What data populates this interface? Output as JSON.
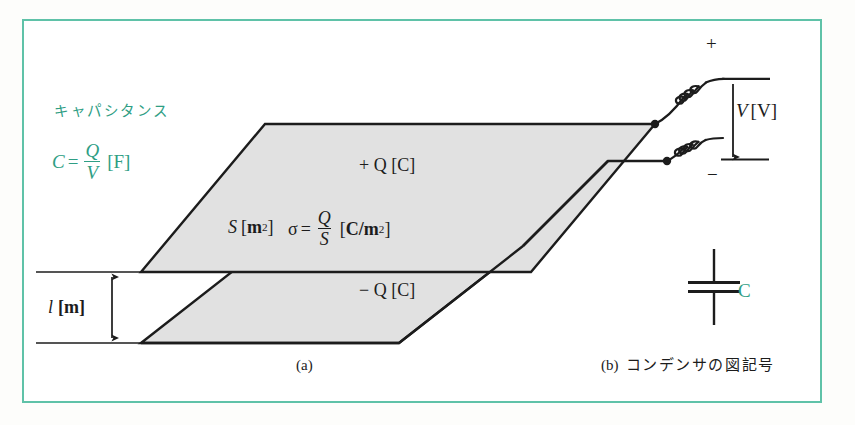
{
  "figure": {
    "title_jp": "キャパシタンス",
    "frame_color": "#5fc2a8",
    "accent_color": "#2f9e84",
    "line_color": "#1c1c1c",
    "plate_fill": "#e0e0e0"
  },
  "panel_a": {
    "caption": "(a)",
    "capacitance_label_jp": "キャパシタンス",
    "capacitance_formula": {
      "lhs": "C",
      "equals": "=",
      "numerator": "Q",
      "denominator": "V",
      "unit": "[F]"
    },
    "plate_area": {
      "symbol": "S",
      "unit_open": "[",
      "unit_base": "m",
      "unit_exp": "2",
      "unit_close": "]"
    },
    "surface_charge_density": {
      "symbol": "σ",
      "equals": "=",
      "numerator": "Q",
      "denominator": "S",
      "unit_open": "[",
      "unit_base": "C/m",
      "unit_exp": "2",
      "unit_close": "]"
    },
    "top_plate_charge": "+ Q [C]",
    "bottom_plate_charge": "− Q [C]",
    "gap_distance": {
      "symbol": "l",
      "unit": "[m]"
    }
  },
  "panel_b": {
    "caption_mark": "(b)",
    "caption_text": "コンデンサの図記号",
    "terminal_positive": "+",
    "terminal_negative": "−",
    "voltage_label": {
      "symbol": "V",
      "unit": "[V]"
    },
    "capacitor_symbol_label": "C"
  }
}
